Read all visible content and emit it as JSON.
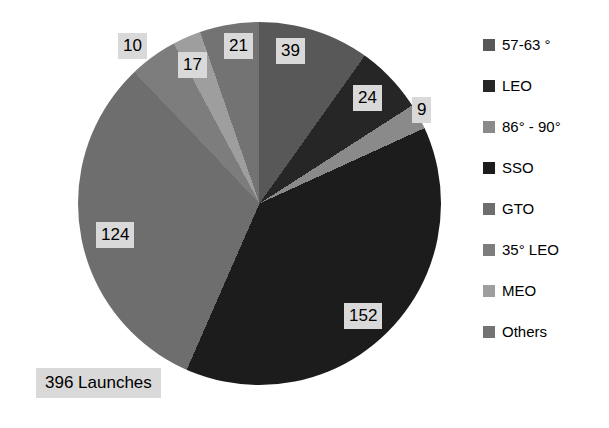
{
  "chart_data": {
    "type": "pie",
    "title": "",
    "subtitle": "",
    "xlabel": "",
    "ylabel": "",
    "legend_position": "right",
    "grid": false,
    "total_label": "396 Launches",
    "total": 396,
    "categories": [
      "57-63 °",
      "LEO",
      "86° - 90°",
      "SSO",
      "GTO",
      "35° LEO",
      "MEO",
      "Others"
    ],
    "values": [
      39,
      24,
      9,
      152,
      124,
      17,
      10,
      21
    ],
    "colors": [
      "#585858",
      "#262626",
      "#8a8a8a",
      "#1c1c1c",
      "#6e6e6e",
      "#7d7d7d",
      "#9e9e9e",
      "#737373"
    ],
    "slices": [
      {
        "label": "57-63 °",
        "value": 39,
        "color": "#585858",
        "value_text": "39",
        "label_x": 276,
        "label_y": 38
      },
      {
        "label": "LEO",
        "value": 24,
        "color": "#262626",
        "value_text": "24",
        "label_x": 353,
        "label_y": 85
      },
      {
        "label": "86° - 90°",
        "value": 9,
        "color": "#8a8a8a",
        "value_text": "9",
        "label_x": 412,
        "label_y": 97
      },
      {
        "label": "SSO",
        "value": 152,
        "color": "#1c1c1c",
        "value_text": "152",
        "label_x": 344,
        "label_y": 303
      },
      {
        "label": "GTO",
        "value": 124,
        "color": "#6e6e6e",
        "value_text": "124",
        "label_x": 96,
        "label_y": 222
      },
      {
        "label": "35° LEO",
        "value": 17,
        "color": "#7d7d7d",
        "value_text": "17",
        "label_x": 178,
        "label_y": 52
      },
      {
        "label": "MEO",
        "value": 10,
        "color": "#9e9e9e",
        "value_text": "10",
        "label_x": 118,
        "label_y": 33
      },
      {
        "label": "Others",
        "value": 21,
        "color": "#737373",
        "value_text": "21",
        "label_x": 224,
        "label_y": 33
      }
    ]
  },
  "legend": {
    "items": [
      {
        "label": "57-63 °",
        "color": "#585858"
      },
      {
        "label": "LEO",
        "color": "#262626"
      },
      {
        "label": "86° - 90°",
        "color": "#8a8a8a"
      },
      {
        "label": "SSO",
        "color": "#1c1c1c"
      },
      {
        "label": "GTO",
        "color": "#6e6e6e"
      },
      {
        "label": "35° LEO",
        "color": "#7d7d7d"
      },
      {
        "label": "MEO",
        "color": "#9e9e9e"
      },
      {
        "label": "Others",
        "color": "#737373"
      }
    ]
  }
}
